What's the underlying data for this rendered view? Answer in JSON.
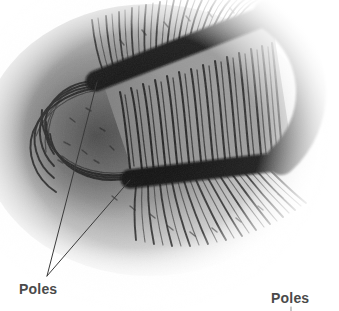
{
  "figure": {
    "background_color": "#ffffff",
    "width": 339,
    "height": 311
  },
  "magnet": {
    "shape": "u-shaped-bar-magnet",
    "body_color": "#0a0a0a",
    "upper_arm": {
      "tip_x": 96,
      "tip_y": 81,
      "end_x": 268,
      "end_y": 14,
      "thickness": 21
    },
    "lower_arm": {
      "tip_x": 130,
      "tip_y": 179,
      "end_x": 281,
      "end_y": 160,
      "thickness": 19
    },
    "bend": {
      "center_x": 272,
      "center_y": 88,
      "outer_radius": 92,
      "inner_radius": 52
    }
  },
  "field": {
    "filings_color": "#1c1c1c",
    "halo_color": "#8c8c8c",
    "interior_color": "#8f8f8f",
    "description": "iron filings aligned along magnetic field lines"
  },
  "labels": {
    "poles_left": "Poles",
    "poles_right": "Poles",
    "text_color": "#4a4a4a"
  },
  "leaders": {
    "line_color": "#3a3a3a",
    "vertex_x": 47,
    "vertex_y": 276,
    "upper_target_x": 97,
    "upper_target_y": 82,
    "lower_target_x": 130,
    "lower_target_y": 180,
    "right_x": 291,
    "right_y": 307
  }
}
